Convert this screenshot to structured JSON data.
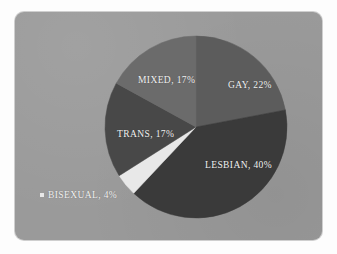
{
  "card": {
    "background_color": "#9a9a9a",
    "page_background_color": "#fdfdfd"
  },
  "legend_marker": {
    "icon": "square-marker",
    "color": "#e8e8e8"
  },
  "chart_data": {
    "type": "pie",
    "title": "",
    "subtitle": "",
    "xlabel": "",
    "ylabel": "",
    "legend_position": "none",
    "grid": false,
    "start_angle_deg": 0,
    "direction": "clockwise",
    "categories": [
      "GAY",
      "LESBIAN",
      "BISEXUAL",
      "TRANS",
      "MIXED"
    ],
    "values": [
      22,
      40,
      4,
      17,
      17
    ],
    "value_unit": "%",
    "slice_colors": [
      "#5c5c5c",
      "#3a3a3a",
      "#e8e8e8",
      "#484848",
      "#6b6b6b"
    ],
    "label_color": "#f2f2f2",
    "slices": [
      {
        "label": "GAY",
        "value": 22,
        "text": "GAY, 22%",
        "color": "#5c5c5c",
        "label_placement": "inside"
      },
      {
        "label": "LESBIAN",
        "value": 40,
        "text": "LESBIAN, 40%",
        "color": "#3a3a3a",
        "label_placement": "inside"
      },
      {
        "label": "BISEXUAL",
        "value": 4,
        "text": "BISEXUAL, 4%",
        "color": "#e8e8e8",
        "label_placement": "outside"
      },
      {
        "label": "TRANS",
        "value": 17,
        "text": "TRANS, 17%",
        "color": "#484848",
        "label_placement": "inside"
      },
      {
        "label": "MIXED",
        "value": 17,
        "text": "MIXED, 17%",
        "color": "#6b6b6b",
        "label_placement": "inside"
      }
    ]
  }
}
